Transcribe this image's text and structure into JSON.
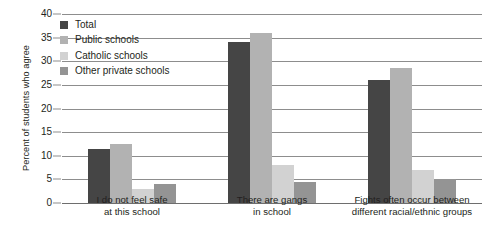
{
  "chart_data": {
    "type": "bar",
    "title": "",
    "xlabel": "",
    "ylabel": "Percent of students who agree",
    "ylim": [
      0,
      40
    ],
    "yticks": [
      0,
      5,
      10,
      15,
      20,
      25,
      30,
      35,
      40
    ],
    "ytick_labels": [
      "0",
      "5",
      "10",
      "15",
      "20",
      "25",
      "30",
      "35",
      "40"
    ],
    "grid": true,
    "legend_position": "upper-left",
    "categories": [
      "I do not feel safe\nat this school",
      "There are gangs\nin school",
      "Fights often occur between\ndifferent racial/ethnic groups"
    ],
    "category_lines": [
      [
        "I do not feel safe",
        "at this school"
      ],
      [
        "There are gangs",
        "in school"
      ],
      [
        "Fights often occur between",
        "different racial/ethnic groups"
      ]
    ],
    "series": [
      {
        "name": "Total",
        "color": "#454545",
        "values": [
          11.5,
          34.0,
          26.0
        ]
      },
      {
        "name": "Public schools",
        "color": "#b2b2b2",
        "values": [
          12.5,
          36.0,
          28.5
        ]
      },
      {
        "name": "Catholic schools",
        "color": "#d2d2d2",
        "values": [
          3.0,
          8.0,
          7.0
        ]
      },
      {
        "name": "Other private schools",
        "color": "#949494",
        "values": [
          4.0,
          4.5,
          5.0
        ]
      }
    ]
  },
  "legend": {
    "items": [
      {
        "label": "Total",
        "color": "#454545"
      },
      {
        "label": "Public schools",
        "color": "#b2b2b2"
      },
      {
        "label": "Catholic schools",
        "color": "#d2d2d2"
      },
      {
        "label": "Other private schools",
        "color": "#949494"
      }
    ]
  },
  "axis": {
    "y_title": "Percent of students who agree"
  },
  "colors": {
    "gridline": "#8d8d8d",
    "text": "#231f20",
    "background": "#ffffff"
  }
}
